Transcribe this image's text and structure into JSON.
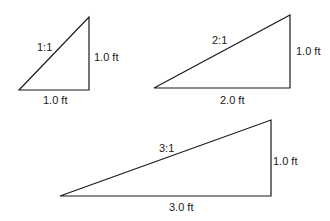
{
  "diagram": {
    "stroke_color": "#1a1a1a",
    "triangles": [
      {
        "slope": "1:1",
        "rise": "1.0 ft",
        "run": "1.0 ft",
        "points": [
          [
            19,
            90
          ],
          [
            89,
            17
          ],
          [
            89,
            90
          ]
        ],
        "slope_pos": [
          37,
          41
        ],
        "rise_pos": [
          94,
          51
        ],
        "run_pos": [
          43,
          94
        ]
      },
      {
        "slope": "2:1",
        "rise": "1.0 ft",
        "run": "2.0 ft",
        "points": [
          [
            154,
            88
          ],
          [
            290,
            15
          ],
          [
            290,
            88
          ]
        ],
        "slope_pos": [
          212,
          34
        ],
        "rise_pos": [
          296,
          45
        ],
        "run_pos": [
          220,
          94
        ]
      },
      {
        "slope": "3:1",
        "rise": "1.0 ft",
        "run": "3.0 ft",
        "points": [
          [
            60,
            196
          ],
          [
            271,
            120
          ],
          [
            271,
            196
          ]
        ],
        "slope_pos": [
          159,
          142
        ],
        "rise_pos": [
          273,
          155
        ],
        "run_pos": [
          169,
          201
        ]
      }
    ]
  }
}
